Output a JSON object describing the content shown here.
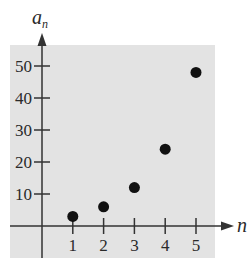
{
  "chart_data": {
    "type": "scatter",
    "title": "",
    "xlabel": "n",
    "ylabel": "a_n",
    "ylabel_main": "a",
    "ylabel_sub": "n",
    "x": [
      1,
      2,
      3,
      4,
      5
    ],
    "values": [
      3,
      6,
      12,
      24,
      48
    ],
    "xlim": [
      -1,
      6
    ],
    "ylim": [
      -10,
      55
    ],
    "x_ticks": [
      "1",
      "2",
      "3",
      "4",
      "5"
    ],
    "y_ticks": [
      "10",
      "20",
      "30",
      "40",
      "50"
    ],
    "grid": false,
    "legend": null,
    "background": "#e3e3e3",
    "point_color": "#111111",
    "axis_color": "#333333"
  }
}
